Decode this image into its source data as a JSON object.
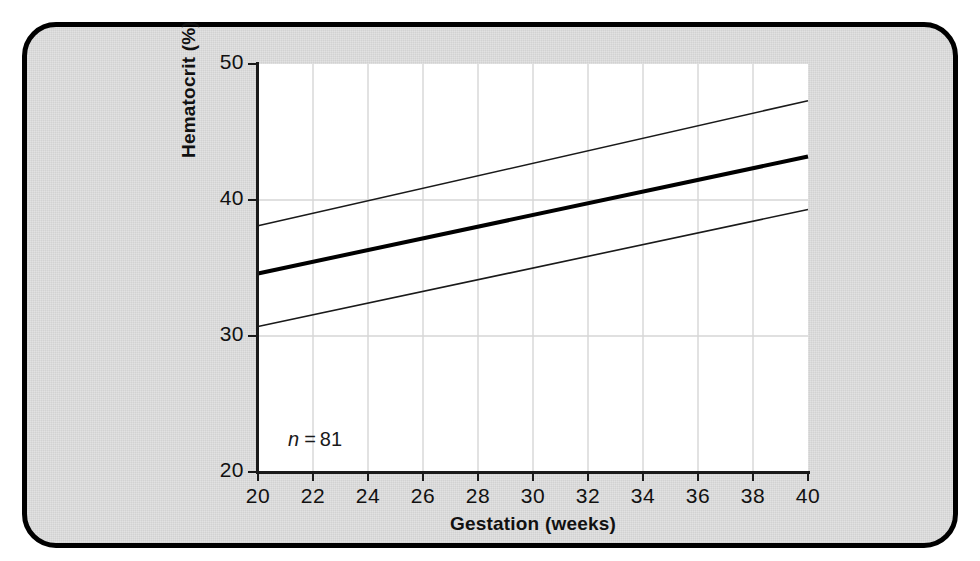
{
  "figure": {
    "panel_border_color": "#000000",
    "panel_background": "#e2e2e2",
    "plot_background": "#ffffff"
  },
  "annotation": {
    "n_symbol": "n",
    "n_equals": "=",
    "n_value": "81"
  },
  "chart_data": {
    "type": "line",
    "title": "",
    "subtitle": "",
    "xlabel": "Gestation (weeks)",
    "ylabel": "Hematocrit (%)",
    "xlim": [
      20,
      40
    ],
    "ylim": [
      20,
      50
    ],
    "xticks": [
      20,
      22,
      24,
      26,
      28,
      30,
      32,
      34,
      36,
      38,
      40
    ],
    "xticklabels": [
      "20",
      "22",
      "24",
      "26",
      "28",
      "30",
      "32",
      "34",
      "36",
      "38",
      "40"
    ],
    "yticks": [
      20,
      30,
      40,
      50
    ],
    "yticklabels": [
      "20",
      "30",
      "40",
      "50"
    ],
    "grid": {
      "vertical": true,
      "horizontal": true,
      "color": "#d6d6d6"
    },
    "legend": {
      "visible": false,
      "position": "none"
    },
    "annotations": [
      {
        "text": "n = 81",
        "x": 20.8,
        "y": 21.6
      }
    ],
    "x": [
      20,
      40
    ],
    "series": [
      {
        "name": "upper-reference-limit",
        "role": "upper",
        "values": [
          38.1,
          47.3
        ],
        "color": "#1a1a1a",
        "width": 1.6
      },
      {
        "name": "mean-regression",
        "role": "mean",
        "values": [
          34.6,
          43.2
        ],
        "color": "#000000",
        "width": 4.0
      },
      {
        "name": "lower-reference-limit",
        "role": "lower",
        "values": [
          30.7,
          39.3
        ],
        "color": "#1a1a1a",
        "width": 1.6
      }
    ]
  }
}
